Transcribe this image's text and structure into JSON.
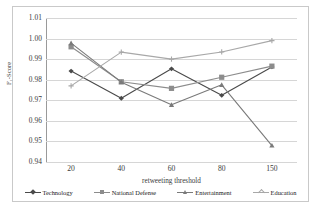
{
  "figure": {
    "background": "#ffffff",
    "frame_color": "#c9c9c9",
    "caption_partial": ""
  },
  "chart_data": {
    "type": "line",
    "title": "",
    "xlabel": "retweeting threshold",
    "ylabel": "F₁-Score",
    "categories": [
      "20",
      "40",
      "60",
      "80",
      "150"
    ],
    "ylim": [
      0.94,
      1.01
    ],
    "yticks": [
      "0.94",
      "0.95",
      "0.96",
      "0.97",
      "0.98",
      "0.99",
      "1.00",
      "1.01"
    ],
    "ytick_values": [
      0.94,
      0.95,
      0.96,
      0.97,
      0.98,
      0.99,
      1.0,
      1.01
    ],
    "grid": true,
    "legend_position": "bottom",
    "series": [
      {
        "name": "Technology",
        "color": "#4a4a4a",
        "marker": "diamond",
        "values": [
          0.9842,
          0.971,
          0.9853,
          0.9724,
          0.9862
        ]
      },
      {
        "name": "National Defense",
        "color": "#8c8c8c",
        "marker": "square",
        "values": [
          0.996,
          0.979,
          0.9758,
          0.9812,
          0.9866
        ]
      },
      {
        "name": "Entertainment",
        "color": "#7a7a7a",
        "marker": "triangle",
        "values": [
          0.9978,
          0.9788,
          0.9678,
          0.9775,
          0.948
        ]
      },
      {
        "name": "Education",
        "color": "#a8a8a8",
        "marker": "cross",
        "values": [
          0.977,
          0.9934,
          0.99,
          0.9935,
          0.999
        ]
      }
    ]
  }
}
